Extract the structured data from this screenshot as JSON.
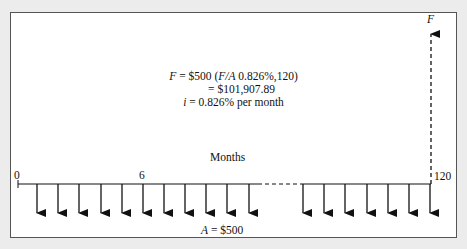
{
  "diagram": {
    "type": "cash-flow-diagram",
    "future_value_label": "F",
    "equation": {
      "line1_prefix": "F",
      "line1_rest": " = $500 (",
      "line1_factor": "F/A",
      "line1_args": " 0.826%,120)",
      "line2": "= $101,907.89",
      "line3_var": "i",
      "line3_rest": " = 0.826% per month"
    },
    "axis": {
      "label": "Months",
      "start_label": "0",
      "mid_label": "6",
      "end_label": "120"
    },
    "payment_label_var": "A",
    "payment_label_rest": " = $500",
    "left_arrows_x": [
      37,
      58,
      79,
      101,
      122,
      143,
      164,
      185,
      206,
      227,
      249
    ],
    "right_arrows_x": [
      303,
      324,
      345,
      367,
      388,
      409,
      430
    ],
    "colors": {
      "line": "#111111",
      "background": "#ececec",
      "panel": "#ffffff"
    }
  }
}
